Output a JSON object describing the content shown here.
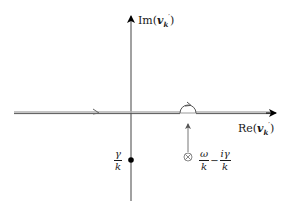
{
  "diagram": {
    "type": "complex-plane contour diagram (Landau contour)",
    "axes": {
      "imaginary_label": {
        "prefix": "Im(",
        "var": "v",
        "sub": "k",
        "sup": "′",
        "suffix": ")"
      },
      "real_label": {
        "prefix": "Re(",
        "var": "v",
        "sub": "k",
        "sup": "′",
        "suffix": ")"
      }
    },
    "points": {
      "dot": {
        "label_num": "γ",
        "label_den": "k",
        "marker": "filled-circle"
      },
      "pole": {
        "marker": "circled-times",
        "symbol": "⊗",
        "term1_num": "ω",
        "term1_den": "k",
        "operator": "−",
        "term2_num": "iγ",
        "term2_den": "k"
      }
    },
    "contour": {
      "path": "along real axis, left to right, with small semicircular detour above pole",
      "arrow_direction": "right"
    },
    "colors": {
      "axis": "#000000",
      "contour_light": "#b0b0b0",
      "contour_dark": "#555555",
      "pole_marker": "#888888",
      "dot": "#000000"
    }
  }
}
